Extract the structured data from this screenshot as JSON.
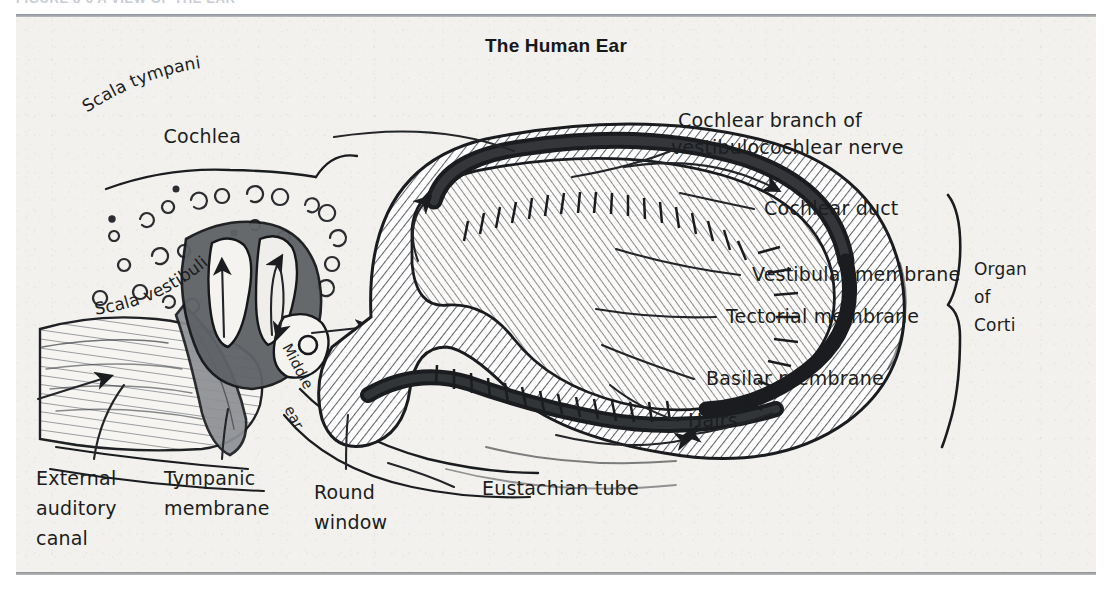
{
  "figure": {
    "caption": "FIGURE 8-6  A VIEW OF THE EAR"
  },
  "plate": {
    "title": "The Human Ear",
    "background_color": "#f2f1ee",
    "rule_color": "#8c8f94",
    "ink_color": "#1a1c1f"
  },
  "labels": {
    "cochlea": "Cochlea",
    "cochlear_branch": {
      "line1": "Cochlear branch of",
      "line2": "vestibulocochlear nerve"
    },
    "cochlear_duct": "Cochlear duct",
    "vestibular_membrane": "Vestibular membrane",
    "tectorial_membrane": "Tectorial membrane",
    "basilar_membrane": "Basilar membrane",
    "hairs": "Hairs",
    "organ_of_corti": {
      "line1": "Organ",
      "line2": "of",
      "line3": "Corti"
    },
    "scala_tympani": "Scala tympani",
    "scala_vestibuli": "Scala vestibuli",
    "middle_ear": {
      "line1": "Middle",
      "line2": "ear"
    },
    "external_auditory_canal": {
      "line1": "External",
      "line2": "auditory",
      "line3": "canal"
    },
    "tympanic_membrane": {
      "line1": "Tympanic",
      "line2": "membrane"
    },
    "round_window": {
      "line1": "Round",
      "line2": "window"
    },
    "eustachian_tube": "Eustachian tube"
  }
}
